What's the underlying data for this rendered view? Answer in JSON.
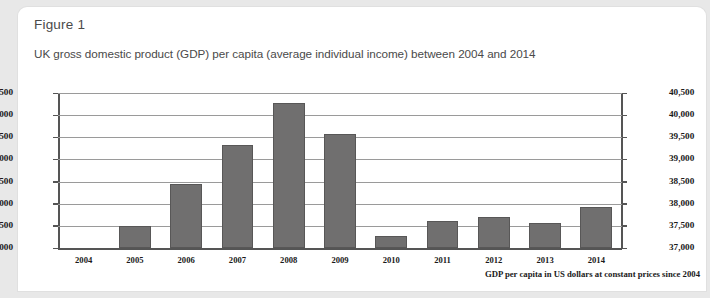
{
  "figure_label": "Figure 1",
  "chart_data": {
    "type": "bar",
    "title": "UK gross domestic product (GDP) per capita (average individual income) between 2004 and 2014",
    "footnote": "GDP per capita in US dollars at constant prices since 2004",
    "xlabel": "",
    "ylabel": "",
    "ylim": [
      37000,
      40500
    ],
    "ytick_step": 500,
    "grid": true,
    "legend": "none",
    "dual_y_axis": true,
    "bar_color": "#706f6f",
    "categories": [
      "2004",
      "2005",
      "2006",
      "2007",
      "2008",
      "2009",
      "2010",
      "2011",
      "2012",
      "2013",
      "2014"
    ],
    "values": [
      null,
      37500,
      38450,
      39320,
      40270,
      39580,
      37270,
      37600,
      37710,
      37560,
      37930
    ],
    "ytick_labels": [
      "40,500",
      "40,000",
      "39,500",
      "39,000",
      "38,500",
      "38,000",
      "37,500",
      "37,000"
    ],
    "ytick_values": [
      40500,
      40000,
      39500,
      39000,
      38500,
      38000,
      37500,
      37000
    ]
  }
}
